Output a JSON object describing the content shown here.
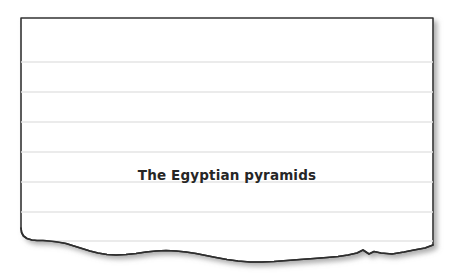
{
  "document": {
    "type": "torn-ruled-notepaper",
    "heading": "The Egyptian pyramids",
    "body_lines": [],
    "colors": {
      "page_background": "#ffffff",
      "paper_fill": "#ffffff",
      "paper_border": "#333333",
      "rule_line": "#e3e3e3",
      "heading_text": "#262626",
      "shadow": "#b8b8b8"
    },
    "geometry": {
      "paper_left": 21,
      "paper_top": 18,
      "paper_right": 433,
      "paper_bottom_intact": 245,
      "rule_spacing": 29.8,
      "rule_first_y": 62,
      "rule_count": 7
    },
    "rule_positions": [
      62,
      92,
      122,
      152,
      182,
      212,
      241
    ],
    "torn_edge_label": "torn-bottom-edge"
  }
}
